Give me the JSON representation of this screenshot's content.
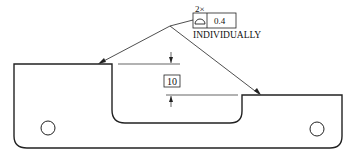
{
  "drawing": {
    "feature_control": {
      "multiplier": "2×",
      "symbol": "profile-of-a-surface-icon",
      "tolerance": "0.4",
      "note": "INDIVIDUALLY"
    },
    "dimension": {
      "value": "10",
      "type": "basic"
    },
    "holes": 2,
    "colors": {
      "line": "#222222",
      "background": "#ffffff"
    }
  }
}
